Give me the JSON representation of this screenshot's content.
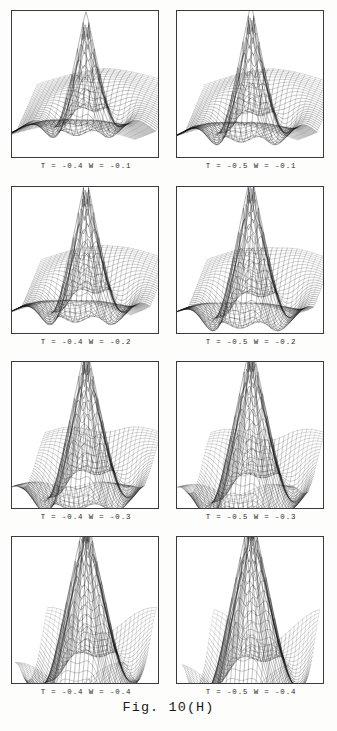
{
  "figure": {
    "label": "Fig. 10(H)",
    "sheet_width": 337,
    "sheet_height": 731,
    "background_color": "#fdfdfc",
    "ink_color": "#111111",
    "frame_color": "#3a3a3a"
  },
  "layout": {
    "columns": 2,
    "rows": 4,
    "panel_width": 150,
    "panel_height": 150,
    "col_x": [
      11,
      176
    ],
    "row_y": [
      10,
      186,
      361,
      536
    ],
    "caption_font_size": 7.4
  },
  "chart_data": {
    "type": "line",
    "title": "Fig. 10(H)",
    "subtitle": "Wireframe surface plots over parameter grid T x W",
    "xlabel": "",
    "ylabel": "",
    "grid": false,
    "legend": "none",
    "projection": "3d-wireframe-mesh",
    "parameters": {
      "T": [
        -0.4,
        -0.5
      ],
      "W": [
        -0.1,
        -0.2,
        -0.3,
        -0.4
      ]
    },
    "panels": [
      {
        "index": 0,
        "row": 0,
        "col": 0,
        "caption": "T = -0.4   W = -0.1",
        "T": -0.4,
        "W": -0.1,
        "mesh_lines": 46,
        "spread": 1.0,
        "peak_height": 0.52,
        "wing_droop": 0.46,
        "core_radius": 0.2,
        "lobe_depth": 0.38
      },
      {
        "index": 1,
        "row": 0,
        "col": 1,
        "caption": "T = -0.5   W = -0.1",
        "T": -0.5,
        "W": -0.1,
        "mesh_lines": 46,
        "spread": 0.95,
        "peak_height": 0.56,
        "wing_droop": 0.44,
        "core_radius": 0.22,
        "lobe_depth": 0.42
      },
      {
        "index": 2,
        "row": 1,
        "col": 0,
        "caption": "T = -0.4   W = -0.2",
        "T": -0.4,
        "W": -0.2,
        "mesh_lines": 46,
        "spread": 0.92,
        "peak_height": 0.58,
        "wing_droop": 0.4,
        "core_radius": 0.24,
        "lobe_depth": 0.44
      },
      {
        "index": 3,
        "row": 1,
        "col": 1,
        "caption": "T = -0.5   W = -0.2",
        "T": -0.5,
        "W": -0.2,
        "mesh_lines": 46,
        "spread": 0.9,
        "peak_height": 0.6,
        "wing_droop": 0.38,
        "core_radius": 0.26,
        "lobe_depth": 0.48
      },
      {
        "index": 4,
        "row": 2,
        "col": 0,
        "caption": "T = -0.4   W = -0.3",
        "T": -0.4,
        "W": -0.3,
        "mesh_lines": 46,
        "spread": 0.84,
        "peak_height": 0.62,
        "wing_droop": 0.32,
        "core_radius": 0.3,
        "lobe_depth": 0.52
      },
      {
        "index": 5,
        "row": 2,
        "col": 1,
        "caption": "T = -0.5   W = -0.3",
        "T": -0.5,
        "W": -0.3,
        "mesh_lines": 46,
        "spread": 0.82,
        "peak_height": 0.64,
        "wing_droop": 0.3,
        "core_radius": 0.32,
        "lobe_depth": 0.55
      },
      {
        "index": 6,
        "row": 3,
        "col": 0,
        "caption": "T = -0.4   W = -0.4",
        "T": -0.4,
        "W": -0.4,
        "mesh_lines": 46,
        "spread": 0.78,
        "peak_height": 0.66,
        "wing_droop": 0.24,
        "core_radius": 0.36,
        "lobe_depth": 0.6
      },
      {
        "index": 7,
        "row": 3,
        "col": 1,
        "caption": "T = -0.5   W = -0.4",
        "T": -0.5,
        "W": -0.4,
        "mesh_lines": 46,
        "spread": 0.76,
        "peak_height": 0.68,
        "wing_droop": 0.22,
        "core_radius": 0.38,
        "lobe_depth": 0.64
      }
    ]
  }
}
